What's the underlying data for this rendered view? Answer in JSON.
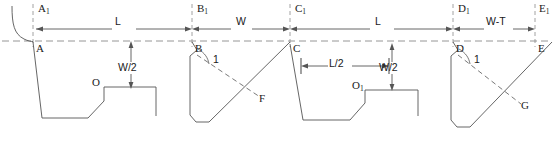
{
  "drawing": {
    "title": "Cross-sectional profile with dimension annotations",
    "stroke_color": "#555555",
    "text_color": "#1a1a1a",
    "background": "#ffffff"
  },
  "dimensions": [
    {
      "name": "dim-L-1",
      "label": "L",
      "x": 122,
      "y": 22
    },
    {
      "name": "dim-W",
      "label": "W",
      "x": 240,
      "y": 22
    },
    {
      "name": "dim-L-2",
      "label": "L",
      "x": 380,
      "y": 22
    },
    {
      "name": "dim-W-T",
      "label": "W-T",
      "x": 495,
      "y": 22
    },
    {
      "name": "dim-W-half-left",
      "label": "W/2",
      "x": 119,
      "y": 69
    },
    {
      "name": "dim-L-half",
      "label": "L/2",
      "x": 333,
      "y": 62
    },
    {
      "name": "dim-W-half-right",
      "label": "W/2",
      "x": 384,
      "y": 69
    }
  ],
  "points": [
    {
      "name": "point-A1",
      "label": "A",
      "sub": "1",
      "x": 35,
      "y": 3
    },
    {
      "name": "point-A",
      "label": "A",
      "sub": "",
      "x": 34,
      "y": 34
    },
    {
      "name": "point-B1",
      "label": "B",
      "sub": "1",
      "x": 194,
      "y": 3
    },
    {
      "name": "point-B",
      "label": "B",
      "sub": "",
      "x": 194,
      "y": 34
    },
    {
      "name": "point-C1",
      "label": "C",
      "sub": "1",
      "x": 292,
      "y": 3
    },
    {
      "name": "point-C",
      "label": "C",
      "sub": "",
      "x": 292,
      "y": 34
    },
    {
      "name": "point-D1",
      "label": "D",
      "sub": "1",
      "x": 455,
      "y": 3
    },
    {
      "name": "point-D",
      "label": "D",
      "sub": "",
      "x": 455,
      "y": 34
    },
    {
      "name": "point-E1",
      "label": "E",
      "sub": "1",
      "x": 537,
      "y": 3
    },
    {
      "name": "point-E",
      "label": "E",
      "sub": "",
      "x": 537,
      "y": 34
    },
    {
      "name": "point-F",
      "label": "F",
      "sub": "",
      "x": 250,
      "y": 98
    },
    {
      "name": "point-G",
      "label": "G",
      "sub": "",
      "x": 512,
      "y": 107
    },
    {
      "name": "point-O",
      "label": "O",
      "sub": "",
      "x": 103,
      "y": 87
    },
    {
      "name": "point-O1",
      "label": "O",
      "sub": "1",
      "x": 363,
      "y": 90
    }
  ],
  "angles": [
    {
      "name": "angle-marker-B",
      "label": "1",
      "x": 215,
      "y": 60
    },
    {
      "name": "angle-marker-D",
      "label": "1",
      "x": 476,
      "y": 60
    }
  ]
}
